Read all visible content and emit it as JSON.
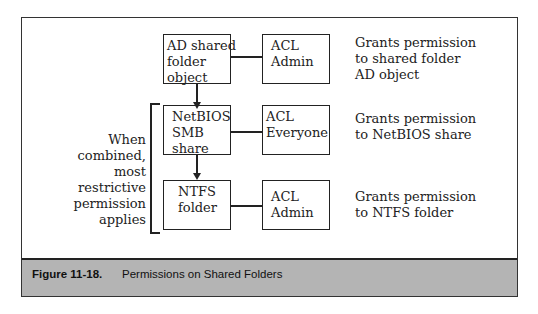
{
  "diagram": {
    "nodes": [
      {
        "id": "ad",
        "lines": [
          "AD shared",
          "folder",
          "object"
        ]
      },
      {
        "id": "acl1",
        "lines": [
          "ACL",
          "Admin"
        ]
      },
      {
        "id": "netbios",
        "lines": [
          "NetBIOS",
          "SMB",
          "share"
        ]
      },
      {
        "id": "acl2",
        "lines": [
          "ACL",
          "Everyone"
        ]
      },
      {
        "id": "ntfs",
        "lines": [
          "NTFS",
          "folder"
        ]
      },
      {
        "id": "acl3",
        "lines": [
          "ACL",
          "Admin"
        ]
      }
    ],
    "descriptions": [
      [
        "Grants permission",
        "to shared folder",
        "AD object"
      ],
      [
        "Grants permission",
        "to NetBIOS share"
      ],
      [
        "Grants permission",
        "to NTFS folder"
      ]
    ],
    "side_note": [
      "When",
      "combined,",
      "most",
      "restrictive",
      "permission",
      "applies"
    ],
    "edges": [
      {
        "from": "ad",
        "to": "acl1",
        "type": "line"
      },
      {
        "from": "ad",
        "to": "netbios",
        "type": "arrow"
      },
      {
        "from": "netbios",
        "to": "acl2",
        "type": "line"
      },
      {
        "from": "netbios",
        "to": "ntfs",
        "type": "arrow"
      },
      {
        "from": "ntfs",
        "to": "acl3",
        "type": "line"
      }
    ]
  },
  "caption": {
    "figure_number": "Figure 11-18.",
    "title": "Permissions on Shared Folders"
  }
}
